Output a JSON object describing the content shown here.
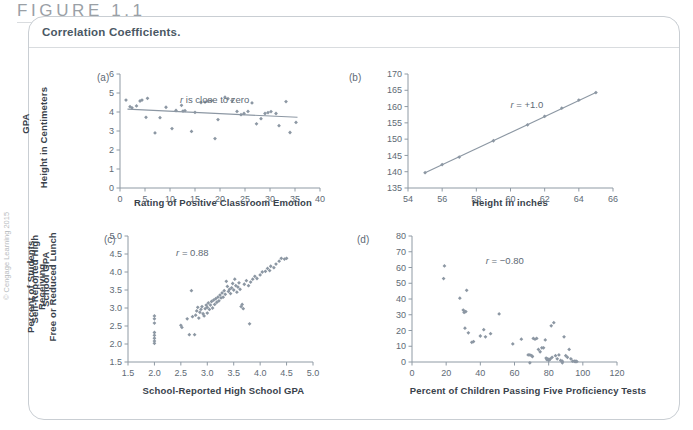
{
  "header": {
    "figure_label": "FIGURE 1.1",
    "caption": "Correlation Coefficients."
  },
  "copyright": "© Cengage Learning 2015",
  "chart_data": [
    {
      "type": "scatter",
      "panel": "(a)",
      "title": "",
      "xlabel": "Rating of Positive Classroom Emotion",
      "ylabel": "GPA",
      "annotation": "r is close to zero",
      "annotation_prefix": "r",
      "annotation_rest": " is close to zero",
      "xlim": [
        0,
        40
      ],
      "ylim": [
        0,
        6
      ],
      "xticks": [
        0,
        5,
        10,
        15,
        20,
        25,
        30,
        35,
        40
      ],
      "yticks": [
        0,
        1,
        2,
        3,
        4,
        5,
        6
      ],
      "grid": false,
      "trendline": {
        "x0": 1.5,
        "y0": 4.15,
        "x1": 35.5,
        "y1": 3.72
      },
      "points": [
        [
          1.2,
          4.63
        ],
        [
          2.0,
          4.28
        ],
        [
          2.4,
          4.22
        ],
        [
          3.3,
          4.32
        ],
        [
          4.0,
          4.58
        ],
        [
          4.4,
          4.63
        ],
        [
          5.2,
          3.72
        ],
        [
          5.5,
          4.72
        ],
        [
          7.0,
          2.9
        ],
        [
          8.0,
          3.7
        ],
        [
          9.2,
          4.25
        ],
        [
          10.4,
          3.13
        ],
        [
          11.2,
          4.08
        ],
        [
          12.3,
          4.35
        ],
        [
          12.6,
          4.05
        ],
        [
          13.0,
          4.07
        ],
        [
          14.3,
          2.98
        ],
        [
          15.0,
          3.98
        ],
        [
          16.2,
          4.5
        ],
        [
          17.0,
          4.52
        ],
        [
          17.6,
          4.57
        ],
        [
          18.3,
          4.6
        ],
        [
          19.0,
          2.6
        ],
        [
          19.6,
          3.6
        ],
        [
          21.0,
          4.78
        ],
        [
          21.6,
          4.7
        ],
        [
          22.4,
          4.6
        ],
        [
          23.4,
          4.03
        ],
        [
          24.2,
          3.86
        ],
        [
          24.8,
          3.92
        ],
        [
          25.6,
          4.03
        ],
        [
          26.4,
          4.48
        ],
        [
          27.3,
          3.38
        ],
        [
          28.2,
          3.65
        ],
        [
          29.0,
          3.92
        ],
        [
          29.6,
          3.97
        ],
        [
          30.2,
          4.02
        ],
        [
          31.2,
          3.92
        ],
        [
          31.8,
          3.28
        ],
        [
          33.2,
          4.55
        ],
        [
          34.0,
          2.92
        ],
        [
          35.2,
          3.45
        ]
      ]
    },
    {
      "type": "scatter",
      "panel": "(b)",
      "title": "",
      "xlabel": "Height in inches",
      "ylabel": "Height in Centimeters",
      "annotation": "r = +1.0",
      "annotation_prefix": "r",
      "annotation_rest": " = +1.0",
      "xlim": [
        54,
        66
      ],
      "ylim": [
        135,
        170
      ],
      "xticks": [
        54,
        56,
        58,
        60,
        62,
        64,
        66
      ],
      "yticks": [
        135,
        140,
        145,
        150,
        155,
        160,
        165,
        170
      ],
      "grid": false,
      "trendline": {
        "x0": 55,
        "y0": 139.7,
        "x1": 65,
        "y1": 164.3
      },
      "points": [
        [
          55,
          139.7
        ],
        [
          56,
          142.2
        ],
        [
          57,
          144.5
        ],
        [
          59,
          149.5
        ],
        [
          61,
          154.4
        ],
        [
          62,
          157.0
        ],
        [
          63,
          159.5
        ],
        [
          64,
          162.0
        ],
        [
          65,
          164.3
        ]
      ]
    },
    {
      "type": "scatter",
      "panel": "(c)",
      "title": "",
      "xlabel": "School-Reported High School GPA",
      "ylabel": "Self-Reported High\nSchool GPA",
      "annotation": "r = 0.88",
      "annotation_prefix": "r",
      "annotation_rest": " = 0.88",
      "xlim": [
        1.5,
        5.0
      ],
      "ylim": [
        1.5,
        5.0
      ],
      "xticks": [
        1.5,
        2.0,
        2.5,
        3.0,
        3.5,
        4.0,
        4.5,
        5.0
      ],
      "yticks": [
        1.5,
        2.0,
        2.5,
        3.0,
        3.5,
        4.0,
        4.5,
        5.0
      ],
      "grid": false,
      "points": [
        [
          2.0,
          2.78
        ],
        [
          2.0,
          2.7
        ],
        [
          2.0,
          2.58
        ],
        [
          2.0,
          2.32
        ],
        [
          2.0,
          2.24
        ],
        [
          2.0,
          2.16
        ],
        [
          2.0,
          2.08
        ],
        [
          2.0,
          2.02
        ],
        [
          2.5,
          2.52
        ],
        [
          2.52,
          2.46
        ],
        [
          2.62,
          2.7
        ],
        [
          2.66,
          2.26
        ],
        [
          2.76,
          2.26
        ],
        [
          2.7,
          3.48
        ],
        [
          2.72,
          2.76
        ],
        [
          2.78,
          2.8
        ],
        [
          2.8,
          2.92
        ],
        [
          2.82,
          3.02
        ],
        [
          2.84,
          2.72
        ],
        [
          2.86,
          2.88
        ],
        [
          2.88,
          2.96
        ],
        [
          2.9,
          3.04
        ],
        [
          2.92,
          2.84
        ],
        [
          2.94,
          2.78
        ],
        [
          2.96,
          2.98
        ],
        [
          2.98,
          3.08
        ],
        [
          3.0,
          2.86
        ],
        [
          3.0,
          3.02
        ],
        [
          3.02,
          3.14
        ],
        [
          3.04,
          2.96
        ],
        [
          3.06,
          3.08
        ],
        [
          3.08,
          3.18
        ],
        [
          3.1,
          3.0
        ],
        [
          3.12,
          3.22
        ],
        [
          3.14,
          3.1
        ],
        [
          3.16,
          3.26
        ],
        [
          3.18,
          3.16
        ],
        [
          3.2,
          3.3
        ],
        [
          3.22,
          3.2
        ],
        [
          3.24,
          3.36
        ],
        [
          3.26,
          3.28
        ],
        [
          3.28,
          3.42
        ],
        [
          3.3,
          3.3
        ],
        [
          3.32,
          3.48
        ],
        [
          3.34,
          3.38
        ],
        [
          3.36,
          3.74
        ],
        [
          3.38,
          3.6
        ],
        [
          3.4,
          3.46
        ],
        [
          3.42,
          3.52
        ],
        [
          3.44,
          3.4
        ],
        [
          3.46,
          3.56
        ],
        [
          3.48,
          3.68
        ],
        [
          3.5,
          3.5
        ],
        [
          3.52,
          3.8
        ],
        [
          3.54,
          3.62
        ],
        [
          3.56,
          3.44
        ],
        [
          3.58,
          3.58
        ],
        [
          3.6,
          3.7
        ],
        [
          3.62,
          3.52
        ],
        [
          3.64,
          3.04
        ],
        [
          3.66,
          3.1
        ],
        [
          3.68,
          2.98
        ],
        [
          3.8,
          2.56
        ],
        [
          3.7,
          3.66
        ],
        [
          3.74,
          3.76
        ],
        [
          3.78,
          3.62
        ],
        [
          3.82,
          3.72
        ],
        [
          3.86,
          3.8
        ],
        [
          3.9,
          3.88
        ],
        [
          3.94,
          3.82
        ],
        [
          4.0,
          3.92
        ],
        [
          4.04,
          4.0
        ],
        [
          4.1,
          4.02
        ],
        [
          4.14,
          4.1
        ],
        [
          4.18,
          4.04
        ],
        [
          4.2,
          4.16
        ],
        [
          4.26,
          4.12
        ],
        [
          4.3,
          4.22
        ],
        [
          4.36,
          4.3
        ],
        [
          4.4,
          4.38
        ],
        [
          4.46,
          4.36
        ],
        [
          4.5,
          4.38
        ]
      ]
    },
    {
      "type": "scatter",
      "panel": "(d)",
      "title": "",
      "xlabel": "Percent of Children Passing Five Proficiency Tests",
      "ylabel": "Percent of Students Receiving\nFree or Reduced Lunch",
      "annotation": "r = −0.80",
      "annotation_prefix": "r",
      "annotation_rest": " = −0.80",
      "xlim": [
        0,
        120
      ],
      "ylim": [
        0,
        80
      ],
      "xticks": [
        0,
        20,
        40,
        60,
        80,
        100,
        120
      ],
      "yticks": [
        0,
        10,
        20,
        30,
        40,
        50,
        60,
        70,
        80
      ],
      "grid": false,
      "points": [
        [
          19,
          61
        ],
        [
          18.5,
          53
        ],
        [
          28,
          40.5
        ],
        [
          30,
          33
        ],
        [
          30.5,
          31.5
        ],
        [
          31,
          32
        ],
        [
          31.5,
          32
        ],
        [
          32,
          45.5
        ],
        [
          31,
          21.5
        ],
        [
          33,
          18.5
        ],
        [
          35,
          12.5
        ],
        [
          36,
          13
        ],
        [
          40,
          16.5
        ],
        [
          42,
          20.5
        ],
        [
          43,
          16
        ],
        [
          46,
          18
        ],
        [
          51,
          30.5
        ],
        [
          59,
          11.5
        ],
        [
          64,
          14.5
        ],
        [
          68,
          4.5
        ],
        [
          69,
          4.5
        ],
        [
          70,
          4
        ],
        [
          70.5,
          3.5
        ],
        [
          69,
          -0.5
        ],
        [
          71,
          15
        ],
        [
          72,
          14.5
        ],
        [
          73,
          15
        ],
        [
          74,
          8
        ],
        [
          75,
          6.5
        ],
        [
          76,
          9
        ],
        [
          77,
          9
        ],
        [
          78,
          14
        ],
        [
          78.5,
          2.5
        ],
        [
          79,
          1.5
        ],
        [
          79.5,
          2
        ],
        [
          80,
          1
        ],
        [
          80.5,
          1.5
        ],
        [
          81,
          2
        ],
        [
          81.5,
          23
        ],
        [
          83,
          25
        ],
        [
          82,
          3
        ],
        [
          84,
          4
        ],
        [
          85,
          2
        ],
        [
          86,
          4.5
        ],
        [
          87,
          1
        ],
        [
          88,
          0.5
        ],
        [
          89,
          16
        ],
        [
          90,
          4
        ],
        [
          91,
          3
        ],
        [
          92,
          8
        ],
        [
          93,
          2
        ],
        [
          94,
          0.5
        ],
        [
          95,
          0.5
        ],
        [
          96,
          0.5
        ],
        [
          88,
          -0.5
        ],
        [
          95.5,
          0.2
        ],
        [
          96.5,
          0.3
        ]
      ]
    }
  ]
}
